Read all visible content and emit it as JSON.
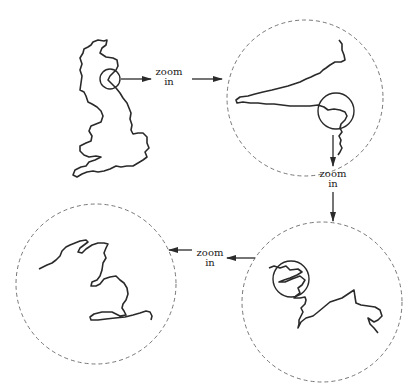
{
  "diagram": {
    "type": "zoom-sequence",
    "colors": {
      "stroke": "#2a2a2a",
      "dashed_circle": "#777777",
      "background": "#ffffff"
    },
    "nodes": [
      {
        "id": "uk-map",
        "label": "Great Britain outline",
        "has_focus_circle": true
      },
      {
        "id": "zoom-level-1",
        "label": "Zoomed coastline (level 1)",
        "has_focus_circle": true
      },
      {
        "id": "zoom-level-2",
        "label": "Zoomed coastline (level 2)",
        "has_focus_circle": true
      },
      {
        "id": "zoom-level-3",
        "label": "Zoomed coastline (level 3)",
        "has_focus_circle": false
      }
    ],
    "edges": [
      {
        "from": "uk-map",
        "to": "zoom-level-1",
        "label_line1": "zoom",
        "label_line2": "in",
        "direction": "right"
      },
      {
        "from": "zoom-level-1",
        "to": "zoom-level-2",
        "label_line1": "zoom",
        "label_line2": "in",
        "direction": "down"
      },
      {
        "from": "zoom-level-2",
        "to": "zoom-level-3",
        "label_line1": "zoom",
        "label_line2": "in",
        "direction": "left"
      }
    ]
  }
}
